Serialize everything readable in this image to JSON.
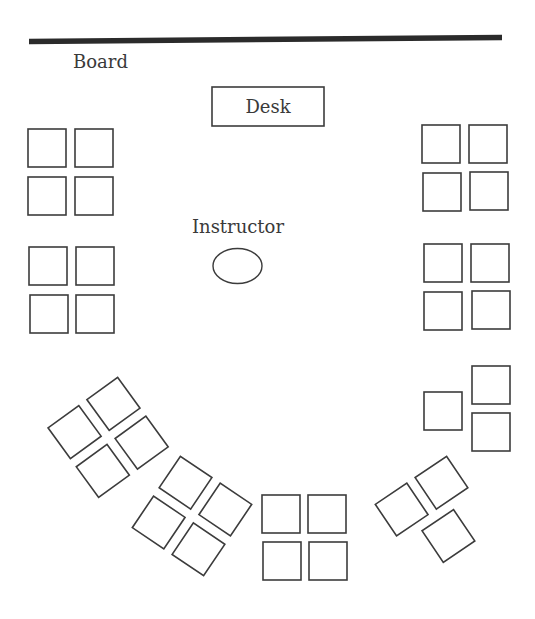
{
  "diagram": {
    "board": {
      "label": "Board",
      "x1": 29,
      "y1": 41.5,
      "x2": 502,
      "y2": 37.5,
      "label_x": 73,
      "label_y": 68
    },
    "desk": {
      "label": "Desk",
      "x": 212,
      "y": 87,
      "w": 112,
      "h": 39
    },
    "instructor": {
      "label": "Instructor",
      "label_x": 238,
      "label_y": 233,
      "cx": 237.5,
      "cy": 266,
      "rx": 24.5,
      "ry": 17.5
    },
    "seat_size": 38,
    "groups": [
      {
        "name": "left-front-group",
        "rotation": 0,
        "seats": [
          [
            28,
            129
          ],
          [
            75,
            129
          ],
          [
            28,
            177
          ],
          [
            75,
            177
          ]
        ]
      },
      {
        "name": "left-middle-group",
        "rotation": 0,
        "seats": [
          [
            29,
            247
          ],
          [
            76,
            247
          ],
          [
            30,
            295
          ],
          [
            76,
            295
          ]
        ]
      },
      {
        "name": "right-front-group",
        "rotation": 0,
        "seats": [
          [
            422,
            125
          ],
          [
            469,
            125
          ],
          [
            423,
            173
          ],
          [
            470,
            172
          ]
        ]
      },
      {
        "name": "right-middle-group",
        "rotation": 0,
        "seats": [
          [
            424,
            244
          ],
          [
            471,
            244
          ],
          [
            424,
            292
          ],
          [
            472,
            291
          ]
        ]
      },
      {
        "name": "right-back-group",
        "rotation": 0,
        "seats": [
          [
            424,
            392
          ],
          [
            472,
            366
          ],
          [
            472,
            413
          ]
        ]
      },
      {
        "name": "bottom-center-group",
        "rotation": 0,
        "seats": [
          [
            262,
            495
          ],
          [
            308,
            495
          ],
          [
            263,
            542
          ],
          [
            309,
            542
          ]
        ]
      }
    ],
    "rotated_groups": [
      {
        "name": "left-back-group",
        "cx": 96,
        "cy": 419,
        "rotation": -36,
        "seats": [
          [
            -44,
            -21
          ],
          [
            4,
            -21
          ],
          [
            -44,
            27
          ],
          [
            4,
            27
          ]
        ]
      },
      {
        "name": "bottom-left-group",
        "cx": 192,
        "cy": 516,
        "rotation": 34,
        "seats": [
          [
            -43,
            -43
          ],
          [
            5,
            -43
          ],
          [
            -43,
            5
          ],
          [
            5,
            5
          ]
        ]
      },
      {
        "name": "bottom-right-group",
        "cx": 435,
        "cy": 516,
        "rotation": -34,
        "seats": [
          [
            -43,
            -43
          ],
          [
            5,
            -43
          ],
          [
            -19,
            5
          ]
        ]
      }
    ]
  }
}
